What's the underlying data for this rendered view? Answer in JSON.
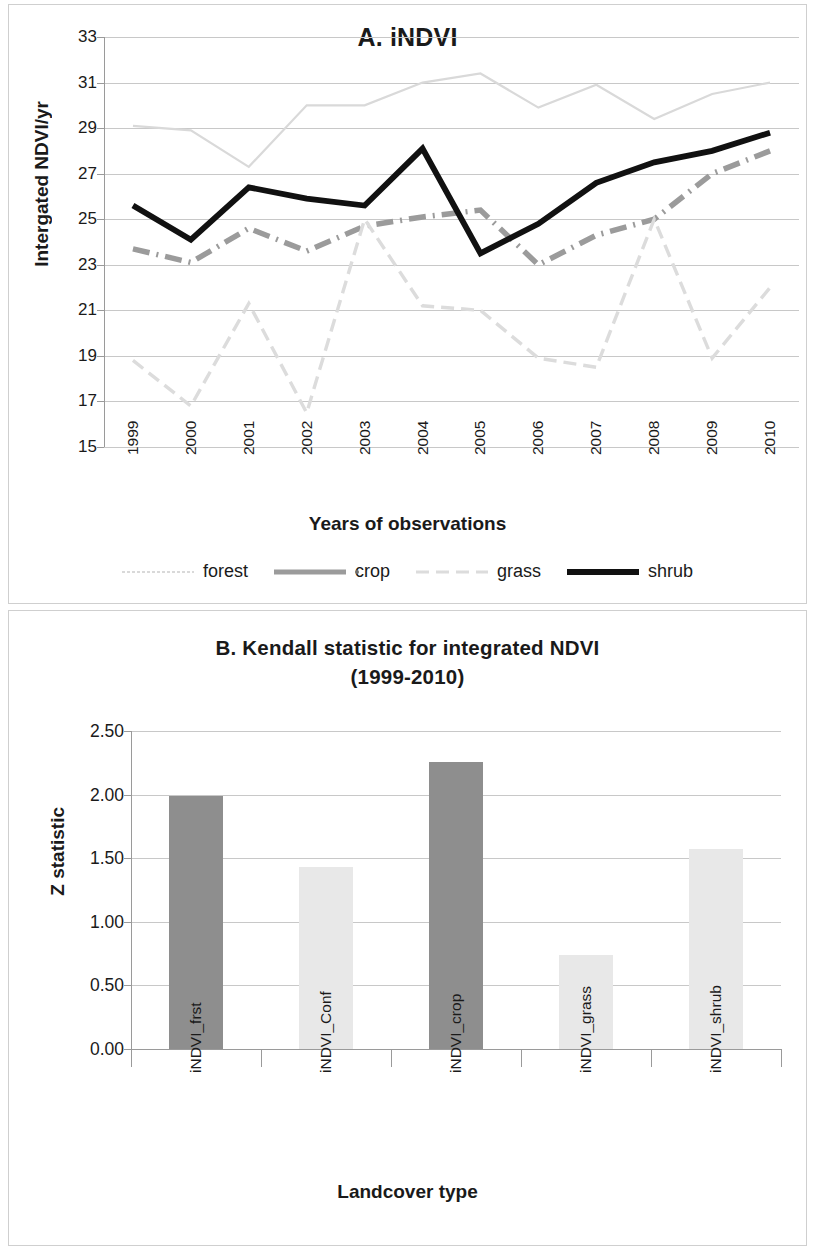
{
  "chart_data": [
    {
      "type": "line",
      "panel": "A",
      "title": "A. iNDVI",
      "xlabel": "Years of observations",
      "ylabel": "Intergated NDVI/yr",
      "x": [
        "1999",
        "2000",
        "2001",
        "2002",
        "2003",
        "2004",
        "2005",
        "2006",
        "2007",
        "2008",
        "2009",
        "2010"
      ],
      "yticks": [
        "33",
        "31",
        "29",
        "27",
        "25",
        "23",
        "21",
        "19",
        "17",
        "15"
      ],
      "ylim": [
        15,
        33
      ],
      "grid": true,
      "legend_position": "bottom",
      "series": [
        {
          "name": "forest",
          "color": "#d9d9d9",
          "style": "thin-solid",
          "values": [
            29.1,
            28.9,
            27.3,
            30.0,
            30.0,
            31.0,
            31.4,
            29.9,
            30.9,
            29.4,
            30.5,
            31.0
          ]
        },
        {
          "name": "crop",
          "color": "#9b9b9b",
          "style": "dash-dot",
          "values": [
            23.7,
            23.1,
            24.6,
            23.6,
            24.7,
            25.1,
            25.4,
            23.0,
            24.3,
            25.0,
            27.0,
            28.0
          ]
        },
        {
          "name": "grass",
          "color": "#dcdcdc",
          "style": "dashed",
          "values": [
            18.8,
            16.8,
            21.3,
            16.5,
            25.0,
            21.2,
            21.0,
            18.9,
            18.5,
            25.0,
            18.9,
            22.0
          ]
        },
        {
          "name": "shrub",
          "color": "#111111",
          "style": "thick-solid",
          "values": [
            25.6,
            24.1,
            26.4,
            25.9,
            25.6,
            28.1,
            23.5,
            24.8,
            26.6,
            27.5,
            28.0,
            28.8
          ]
        }
      ]
    },
    {
      "type": "bar",
      "panel": "B",
      "title": "B. Kendall statistic for integrated NDVI",
      "subtitle": "(1999-2010)",
      "xlabel": "Landcover type",
      "ylabel": "Z statistic",
      "categories": [
        "iNDVI_frst",
        "iNDVI_Conf",
        "iNDVI_crop",
        "iNDVI_grass",
        "iNDVI_shrub"
      ],
      "values": [
        1.99,
        1.43,
        2.26,
        0.74,
        1.57
      ],
      "colors": [
        "#8e8e8e",
        "#e8e8e8",
        "#8e8e8e",
        "#e8e8e8",
        "#e8e8e8"
      ],
      "yticks": [
        "2.50",
        "2.00",
        "1.50",
        "1.00",
        "0.50",
        "0.00"
      ],
      "ylim": [
        0,
        2.5
      ],
      "grid": true
    }
  ]
}
